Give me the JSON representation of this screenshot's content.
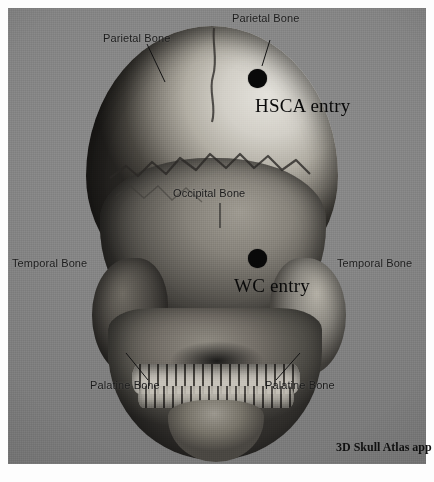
{
  "figure": {
    "credit": "3D Skull Atlas app",
    "background_color": "#818181",
    "bone_highlight_color": "#d8d8d8",
    "bone_shadow_color": "#2e2e2e",
    "marker_color": "#090909"
  },
  "entries": [
    {
      "id": "hsca",
      "label": "HSCA entry",
      "dot_x": 257,
      "dot_y": 78,
      "label_x": 255,
      "label_y": 95
    },
    {
      "id": "wc",
      "label": "WC entry",
      "dot_x": 257,
      "dot_y": 258,
      "label_x": 234,
      "label_y": 275
    }
  ],
  "annotations": [
    {
      "id": "parietal-left",
      "label": "Parietal Bone",
      "x": 103,
      "y": 32
    },
    {
      "id": "parietal-top",
      "label": "Parietal Bone",
      "x": 232,
      "y": 12
    },
    {
      "id": "occipital",
      "label": "Occipital Bone",
      "x": 173,
      "y": 187
    },
    {
      "id": "temporal-left",
      "label": "Temporal Bone",
      "x": 12,
      "y": 257
    },
    {
      "id": "temporal-right",
      "label": "Temporal Bone",
      "x": 337,
      "y": 257
    },
    {
      "id": "palatine-left",
      "label": "Palatine Bone",
      "x": 90,
      "y": 379
    },
    {
      "id": "palatine-right",
      "label": "Palatine Bone",
      "x": 265,
      "y": 379
    }
  ]
}
